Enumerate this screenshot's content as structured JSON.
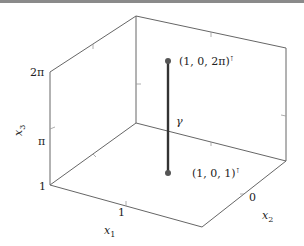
{
  "figure": {
    "type": "3d-axis-box-plot",
    "axes": {
      "x1": {
        "label": "x",
        "subscript": "1",
        "ticks": [
          "1"
        ]
      },
      "x2": {
        "label": "x",
        "subscript": "2",
        "ticks": [
          "0"
        ]
      },
      "x3": {
        "label": "x",
        "subscript": "3",
        "ticks": [
          "1",
          "π",
          "2π"
        ]
      }
    },
    "curve": {
      "label": "γ",
      "start": {
        "label": "(1, 0, 1)",
        "superscript": "⊺"
      },
      "end": {
        "label": "(1, 0, 2π)",
        "superscript": "⊺"
      }
    },
    "colors": {
      "axis": "#555555",
      "curve": "#333333",
      "point": "#555555",
      "topbar": "#8a8a8a"
    }
  }
}
